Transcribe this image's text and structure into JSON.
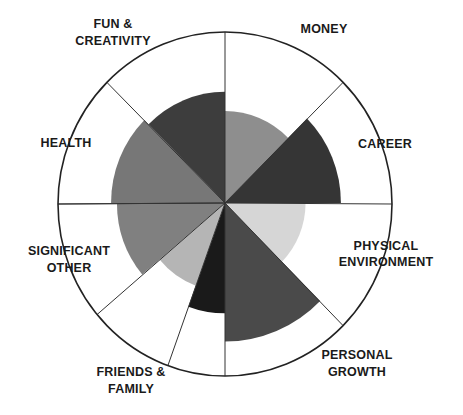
{
  "chart_data": {
    "type": "radial-bar",
    "title": "",
    "center": [
      225,
      203
    ],
    "outer_radius": 170,
    "scale_max": 10,
    "segments": [
      {
        "key": "money",
        "label_lines": [
          "MONEY"
        ],
        "start_deg": 45,
        "end_deg": 90,
        "fill_radius_px": 91,
        "value": 5.4,
        "color": "#8e8e8e"
      },
      {
        "key": "career",
        "label_lines": [
          "CAREER"
        ],
        "start_deg": 0,
        "end_deg": 45,
        "fill_radius_px": 118,
        "value": 6.9,
        "color": "#353535"
      },
      {
        "key": "physical_environment",
        "label_lines": [
          "PHYSICAL",
          "ENVIRONMENT"
        ],
        "start_deg": -45,
        "end_deg": 0,
        "fill_radius_px": 82,
        "value": 4.8,
        "color": "#d6d6d6"
      },
      {
        "key": "personal_growth",
        "label_lines": [
          "PERSONAL",
          "GROWTH"
        ],
        "start_deg": -90,
        "end_deg": -45,
        "fill_radius_px": 137,
        "value": 8.1,
        "color": "#4a4a4a"
      },
      {
        "key": "unlabeled",
        "label_lines": [],
        "start_deg": -110,
        "end_deg": -90,
        "fill_radius_px": 109,
        "value": 6.4,
        "color": "#1a1a1a"
      },
      {
        "key": "friends_family",
        "label_lines": [
          "FRIENDS &",
          "FAMILY"
        ],
        "start_deg": -140,
        "end_deg": -110,
        "fill_radius_px": 87,
        "value": 5.1,
        "color": "#b5b5b5"
      },
      {
        "key": "significant_other",
        "label_lines": [
          "SIGNIFICANT",
          "OTHER"
        ],
        "start_deg": -180,
        "end_deg": -140,
        "fill_radius_px": 110,
        "value": 6.5,
        "color": "#808080"
      },
      {
        "key": "health",
        "label_lines": [
          "HEALTH"
        ],
        "start_deg": 135,
        "end_deg": 180,
        "fill_radius_px": 116,
        "value": 6.8,
        "color": "#777777"
      },
      {
        "key": "fun_creativity",
        "label_lines": [
          "FUN &",
          "CREATIVITY"
        ],
        "start_deg": 90,
        "end_deg": 135,
        "fill_radius_px": 110,
        "value": 6.5,
        "color": "#3d3d3d"
      }
    ],
    "legend": "none",
    "grid": false
  },
  "labels": {
    "money": [
      "MONEY"
    ],
    "career": [
      "CAREER"
    ],
    "physical_environment": [
      "PHYSICAL",
      "ENVIRONMENT"
    ],
    "personal_growth": [
      "PERSONAL",
      "GROWTH"
    ],
    "friends_family": [
      "FRIENDS &",
      "FAMILY"
    ],
    "significant_other": [
      "SIGNIFICANT",
      "OTHER"
    ],
    "health": [
      "HEALTH"
    ],
    "fun_creativity": [
      "FUN &",
      "CREATIVITY"
    ]
  }
}
